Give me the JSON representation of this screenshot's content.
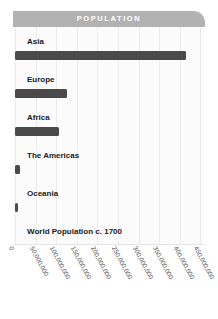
{
  "card": {
    "header_title": "POPULATION"
  },
  "colors": {
    "header_bg": "#b2b2b2",
    "header_text": "#ffffff",
    "bar": "#4a4a4a",
    "plot_bg": "#fbfbfb",
    "gridline": "#ececec",
    "label_text": "#1a1a1a",
    "tick_text": "#4d4d4d"
  },
  "chart_data": {
    "type": "bar",
    "orientation": "horizontal",
    "title": "POPULATION",
    "xlabel": "",
    "ylabel": "",
    "categories": [
      "Asia",
      "Europe",
      "Africa",
      "The Americas",
      "Oceania",
      "World Population c. 1700"
    ],
    "values": [
      415000000,
      125000000,
      107000000,
      13000000,
      3000000,
      null
    ],
    "xlim": [
      0,
      480000000
    ],
    "xticks": [
      0,
      50000000,
      100000000,
      150000000,
      200000000,
      250000000,
      300000000,
      350000000,
      400000000,
      450000000
    ],
    "xtick_labels": [
      "0",
      "50,000,000",
      "100,000,000",
      "150,000,000",
      "200,000,000",
      "250,000,000",
      "300,000,000",
      "350,000,000",
      "400,000,000",
      "450,000,000"
    ],
    "grid": true,
    "grid_axis": "x",
    "legend": false
  }
}
